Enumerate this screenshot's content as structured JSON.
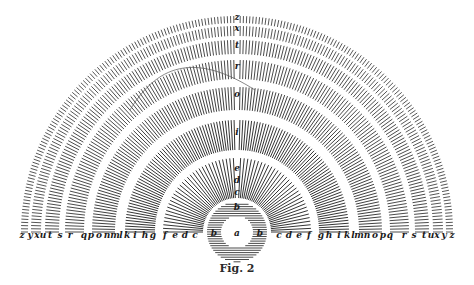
{
  "figure": {
    "caption": "Fig. 2",
    "center_label": "a",
    "inner_circle_labels": {
      "top": "b",
      "left": "b",
      "right": "b"
    },
    "vertical_labels": [
      "z",
      "x",
      "t",
      "r",
      "o",
      "i",
      "e",
      "d",
      "c",
      "b"
    ],
    "baseline_left_labels": [
      "z",
      "y",
      "x",
      "u",
      "t",
      "s",
      "r",
      "q",
      "p",
      "o",
      "n",
      "m",
      "l",
      "k",
      "i",
      "h",
      "g",
      "f",
      "e",
      "d",
      "c"
    ],
    "baseline_right_labels": [
      "c",
      "d",
      "e",
      "f",
      "g",
      "h",
      "i",
      "k",
      "l",
      "m",
      "n",
      "o",
      "p",
      "q",
      "r",
      "s",
      "t",
      "u",
      "x",
      "y",
      "z"
    ],
    "rings": [
      {
        "name": "ring-inner-circle",
        "kind": "full-circle"
      },
      {
        "name": "ring-f-g",
        "kind": "semicircle"
      },
      {
        "name": "ring-h-k",
        "kind": "semicircle"
      },
      {
        "name": "ring-m-o",
        "kind": "semicircle"
      },
      {
        "name": "ring-q-r",
        "kind": "semicircle"
      },
      {
        "name": "ring-t",
        "kind": "semicircle"
      },
      {
        "name": "ring-x",
        "kind": "semicircle"
      },
      {
        "name": "ring-z",
        "kind": "semicircle"
      }
    ],
    "colors": {
      "ink": "#1d1d1d",
      "background": "#ffffff"
    }
  }
}
